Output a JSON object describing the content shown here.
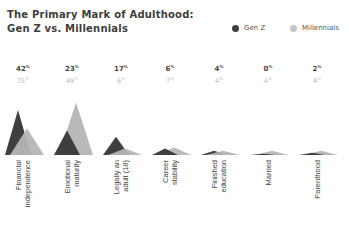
{
  "title_line1": "The Primary Mark of Adulthood:",
  "title_line2": "Gen Z vs. Millennials",
  "legend": [
    {
      "name": "Gen Z",
      "color": "#3f3f3f"
    },
    {
      "name": "Millennials",
      "color": "#b5b5b5"
    }
  ],
  "chart_data": {
    "type": "area",
    "title": "The Primary Mark of Adulthood: Gen Z vs. Millennials",
    "xlabel": "",
    "ylabel": "",
    "unit": "%",
    "grid": false,
    "legend_position": "top-right",
    "categories": [
      "Financial independence",
      "Emotional maturity",
      "Legally an adult (18)",
      "Career stability",
      "Finished education",
      "Married",
      "Parenthood"
    ],
    "series": [
      {
        "name": "Gen Z",
        "color": "#3f3f3f",
        "values": [
          42,
          23,
          17,
          6,
          4,
          0,
          2
        ]
      },
      {
        "name": "Millennials",
        "color": "#b5b5b5",
        "values": [
          25,
          49,
          6,
          7,
          4,
          4,
          4
        ]
      }
    ]
  },
  "labels": [
    {
      "line1": "Financial",
      "line2": "independence",
      "genz": "42",
      "mill": "25"
    },
    {
      "line1": "Emotional",
      "line2": "maturity",
      "genz": "23",
      "mill": "49"
    },
    {
      "line1": "Legally an",
      "line2": "adult (18)",
      "genz": "17",
      "mill": "6"
    },
    {
      "line1": "Career",
      "line2": "stability",
      "genz": "6",
      "mill": "7"
    },
    {
      "line1": "Finished",
      "line2": "education",
      "genz": "4",
      "mill": "4"
    },
    {
      "line1": "Married",
      "line2": "",
      "genz": "0",
      "mill": "4"
    },
    {
      "line1": "Parenthood",
      "line2": "",
      "genz": "2",
      "mill": "4"
    }
  ],
  "pct": "%"
}
